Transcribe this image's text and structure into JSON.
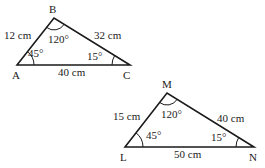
{
  "figure": {
    "triangles": [
      {
        "name": "ABC",
        "vertices": [
          {
            "label": "A",
            "x": 17,
            "y": 65
          },
          {
            "label": "B",
            "x": 54,
            "y": 18
          },
          {
            "label": "C",
            "x": 130,
            "y": 65
          }
        ],
        "sides": [
          {
            "between": "AB",
            "label": "12 cm"
          },
          {
            "between": "BC",
            "label": "32 cm"
          },
          {
            "between": "AC",
            "label": "40 cm"
          }
        ],
        "angles": [
          {
            "at": "A",
            "label": "45°"
          },
          {
            "at": "B",
            "label": "120°"
          },
          {
            "at": "C",
            "label": "15°"
          }
        ]
      },
      {
        "name": "LMN",
        "vertices": [
          {
            "label": "L",
            "x": 125,
            "y": 147
          },
          {
            "label": "M",
            "x": 167,
            "y": 93
          },
          {
            "label": "N",
            "x": 254,
            "y": 147
          }
        ],
        "sides": [
          {
            "between": "LM",
            "label": "15 cm"
          },
          {
            "between": "MN",
            "label": "40 cm"
          },
          {
            "between": "LN",
            "label": "50 cm"
          }
        ],
        "angles": [
          {
            "at": "L",
            "label": "45°"
          },
          {
            "at": "M",
            "label": "120°"
          },
          {
            "at": "N",
            "label": "15°"
          }
        ]
      }
    ]
  }
}
